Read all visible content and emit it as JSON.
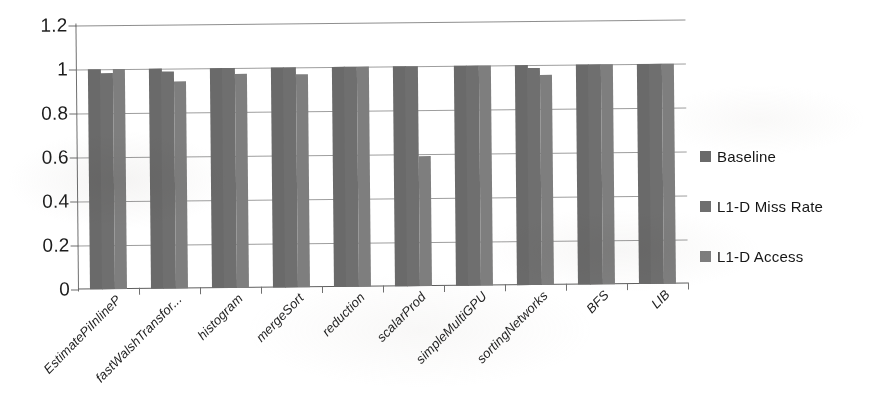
{
  "chart_data": {
    "type": "bar",
    "title": "",
    "subtitle": "",
    "xlabel": "",
    "ylabel": "",
    "ylim": [
      0,
      1.2
    ],
    "yticks": [
      "0",
      "0.2",
      "0.4",
      "0.6",
      "0.8",
      "1",
      "1.2"
    ],
    "ytick_values": [
      0,
      0.2,
      0.4,
      0.6,
      0.8,
      1,
      1.2
    ],
    "grid": true,
    "grid_axis": "y",
    "legend_position": "right",
    "categories": [
      "EstimatePiInlineP",
      "fastWalshTransfor...",
      "histogram",
      "mergeSort",
      "reduction",
      "scalarProd",
      "simpleMultiGPU",
      "sortingNetworks",
      "BFS",
      "LIB"
    ],
    "series": [
      {
        "name": "Baseline",
        "color": "#6a6a6a",
        "values": [
          1.0,
          1.0,
          1.0,
          1.0,
          1.0,
          1.0,
          1.0,
          1.0,
          1.0,
          1.0
        ]
      },
      {
        "name": "L1-D Miss Rate",
        "color": "#6f6f6f",
        "values": [
          0.98,
          0.985,
          1.0,
          1.0,
          1.0,
          1.0,
          1.0,
          0.985,
          1.0,
          1.0
        ]
      },
      {
        "name": "L1-D Access",
        "color": "#7e7e7e",
        "values": [
          1.0,
          0.94,
          0.975,
          0.97,
          1.0,
          0.59,
          1.0,
          0.955,
          1.0,
          1.0
        ]
      }
    ]
  },
  "legend": {
    "items": [
      {
        "label": "Baseline",
        "swatch_class": "s0"
      },
      {
        "label": "L1-D Miss Rate",
        "swatch_class": "s1"
      },
      {
        "label": "L1-D Access",
        "swatch_class": "s2"
      }
    ]
  },
  "colors": {
    "series_baseline": "#6a6a6a",
    "series_miss_rate": "#6f6f6f",
    "series_access": "#7e7e7e",
    "grid": "#8d8d8d",
    "axis": "#5f5f5f",
    "background": "#ffffff",
    "text": "#1d1d1d"
  }
}
